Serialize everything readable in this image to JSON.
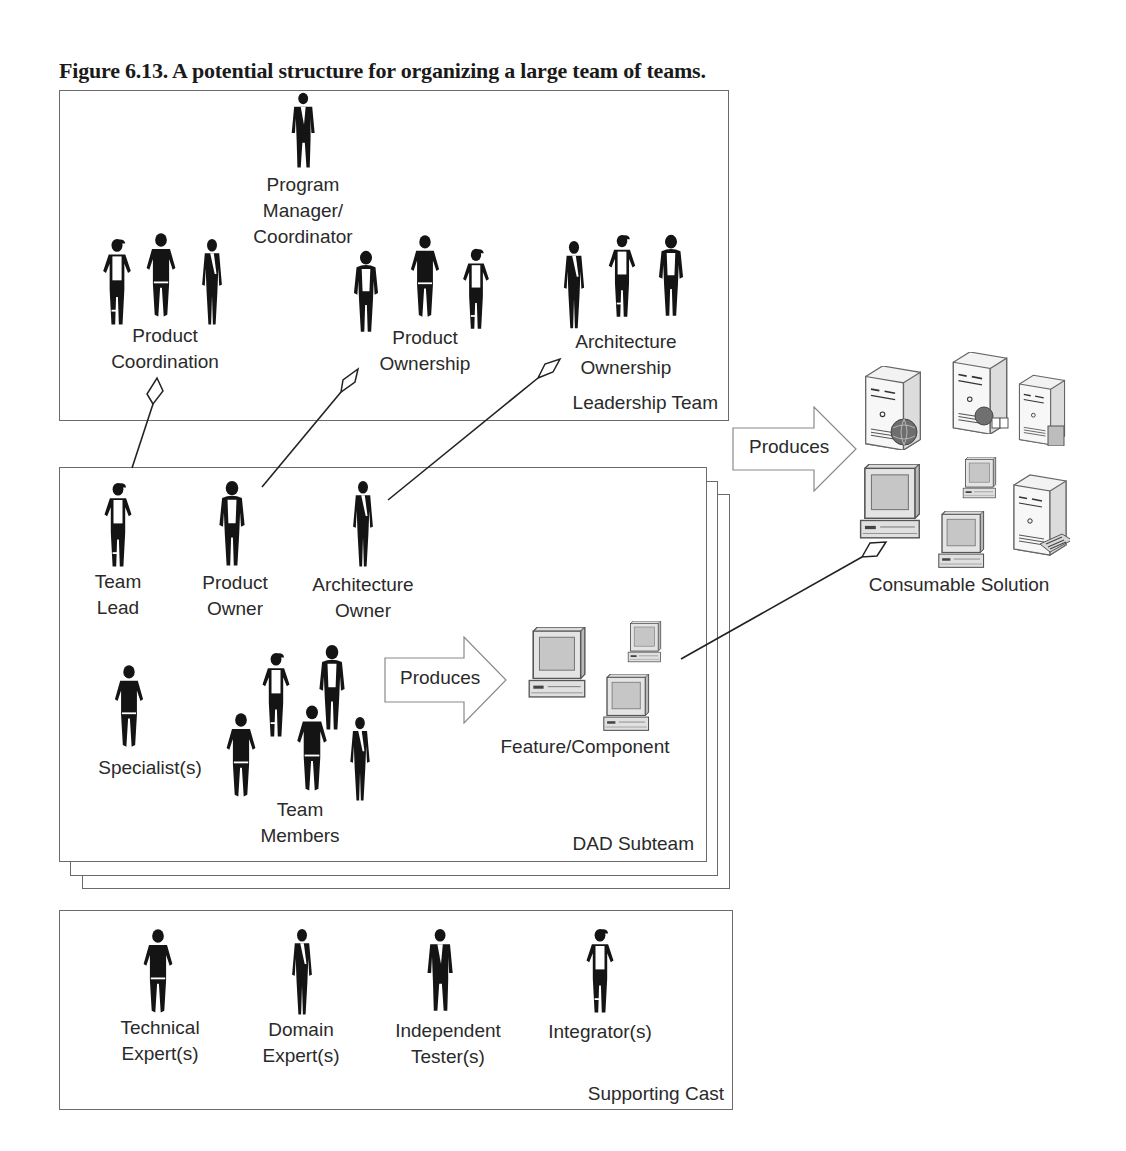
{
  "caption": "Figure 6.13. A potential structure for organizing a large team of teams.",
  "leadership_team": {
    "title": "Leadership Team",
    "roles": [
      {
        "id": "program-manager",
        "lines": [
          "Program",
          "Manager/",
          "Coordinator"
        ],
        "figures": 1
      },
      {
        "id": "product-coordination",
        "lines": [
          "Product",
          "Coordination"
        ],
        "figures": 3
      },
      {
        "id": "product-ownership",
        "lines": [
          "Product",
          "Ownership"
        ],
        "figures": 3
      },
      {
        "id": "architecture-ownership",
        "lines": [
          "Architecture",
          "Ownership"
        ],
        "figures": 3
      }
    ]
  },
  "dad_subteam": {
    "title": "DAD Subteam",
    "stack_count": 3,
    "roles": [
      {
        "id": "team-lead",
        "lines": [
          "Team",
          "Lead"
        ]
      },
      {
        "id": "product-owner",
        "lines": [
          "Product",
          "Owner"
        ]
      },
      {
        "id": "architecture-owner",
        "lines": [
          "Architecture",
          "Owner"
        ]
      },
      {
        "id": "specialists",
        "lines": [
          "Specialist(s)"
        ]
      },
      {
        "id": "team-members",
        "lines": [
          "Team",
          "Members"
        ],
        "figures": 5
      }
    ],
    "produces_arrow": "Produces",
    "output": "Feature/Component"
  },
  "consumable_solution": {
    "produces_arrow": "Produces",
    "label": "Consumable Solution"
  },
  "supporting_cast": {
    "title": "Supporting Cast",
    "roles": [
      {
        "id": "technical-experts",
        "lines": [
          "Technical",
          "Expert(s)"
        ]
      },
      {
        "id": "domain-experts",
        "lines": [
          "Domain",
          "Expert(s)"
        ]
      },
      {
        "id": "independent-testers",
        "lines": [
          "Independent",
          "Tester(s)"
        ]
      },
      {
        "id": "integrators",
        "lines": [
          "Integrator(s)"
        ]
      }
    ]
  },
  "connectors": [
    {
      "from": "team-lead",
      "to": "product-coordination",
      "type": "aggregation"
    },
    {
      "from": "product-owner",
      "to": "product-ownership",
      "type": "aggregation"
    },
    {
      "from": "architecture-owner",
      "to": "architecture-ownership",
      "type": "aggregation"
    },
    {
      "from": "feature-component",
      "to": "consumable-solution",
      "type": "aggregation"
    }
  ],
  "colors": {
    "box_border": "#6a6a6a",
    "silhouette": "#141414",
    "text": "#2a2a2a",
    "device_body": "#e6e6e6",
    "device_screen": "#c9c9c9"
  }
}
